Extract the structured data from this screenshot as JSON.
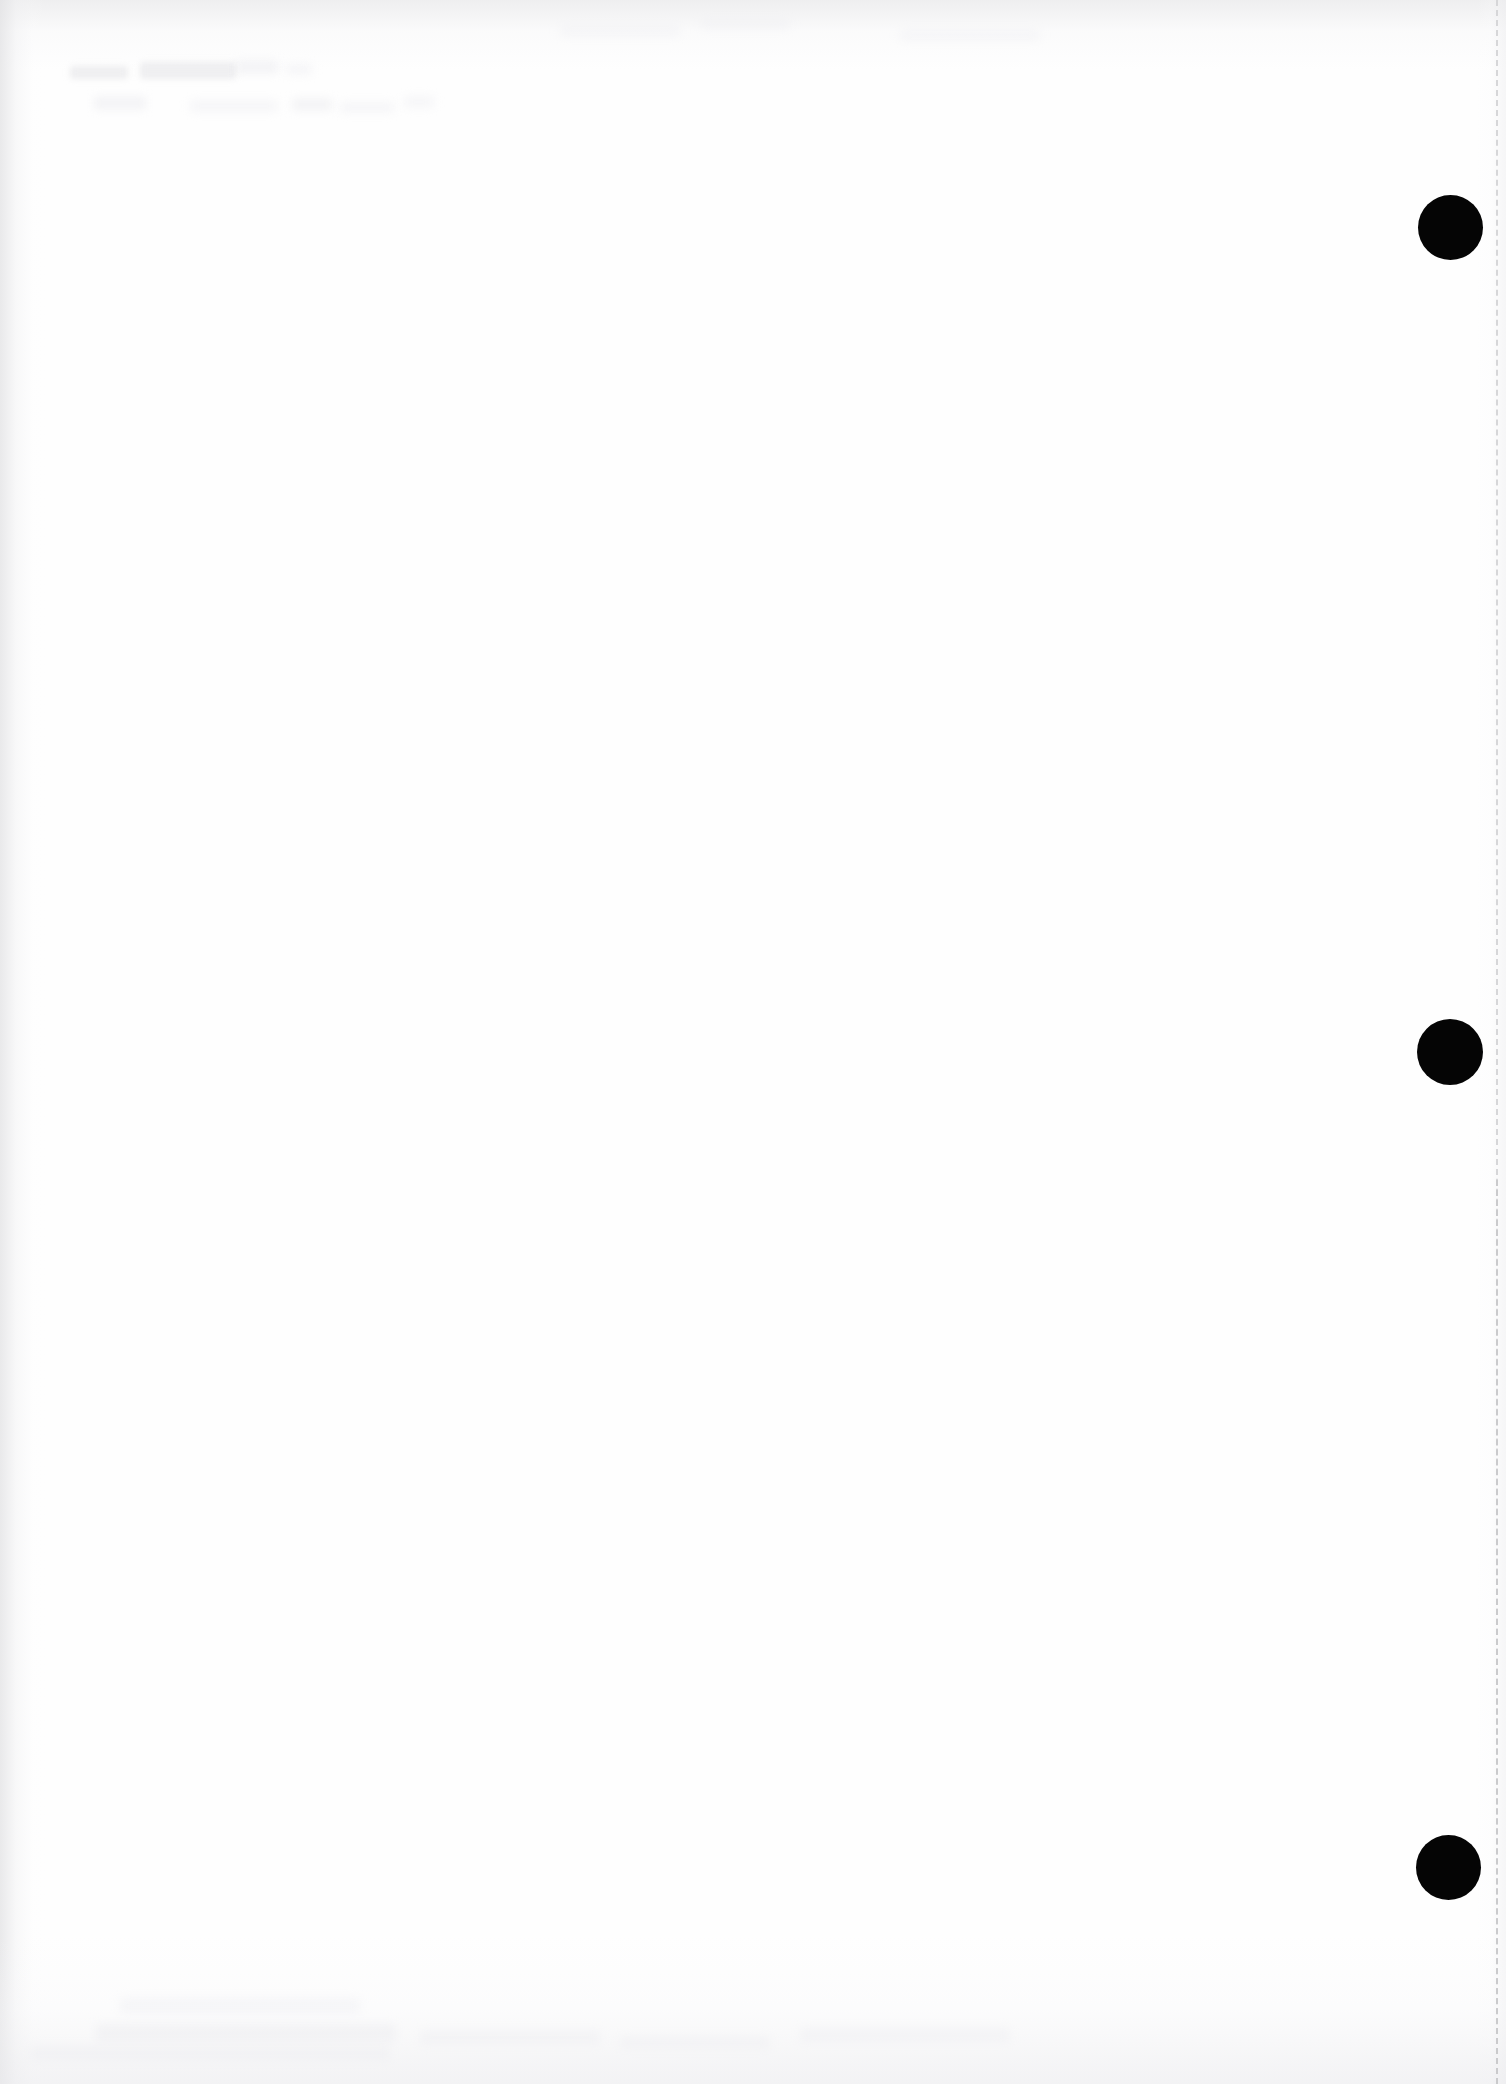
{
  "document": {
    "kind": "scanned-page",
    "title": "Scanned blank page with right-margin registration marks",
    "page_width": 1506,
    "page_height": 2084,
    "paper_color": "#fefefe",
    "content_text": "",
    "visible_text_present": false,
    "notes_label": ""
  },
  "marks": {
    "registration_dots_label": "registration mark",
    "dot_color": "#050505",
    "dots": [
      {
        "id": "registration-dot-1",
        "cx": 1450,
        "cy": 227,
        "diameter": 65
      },
      {
        "id": "registration-dot-2",
        "cx": 1450,
        "cy": 1052,
        "diameter": 66
      },
      {
        "id": "registration-dot-3",
        "cx": 1448,
        "cy": 1867,
        "diameter": 65
      }
    ]
  },
  "guides": {
    "perforation_label": "perforation guide",
    "dash_color": "#d6d6d8",
    "dash_color_lower": "#cacacc",
    "x_position": 1496,
    "dash_length": 11,
    "dash_gap": 11
  },
  "scan_artifacts": {
    "label": "scan noise and bleed-through",
    "vignette_color_left": "#e2e2e4",
    "vignette_color_top": "#e4e4e6",
    "vignette_color_bottom": "#e9e9ec",
    "smudges": [
      {
        "x": 70,
        "y": 66,
        "w": 58,
        "h": 13,
        "class": "bleed-smudge"
      },
      {
        "x": 140,
        "y": 62,
        "w": 96,
        "h": 17,
        "class": "bleed-smudge"
      },
      {
        "x": 236,
        "y": 60,
        "w": 42,
        "h": 14,
        "class": "bleed-smudge soft"
      },
      {
        "x": 286,
        "y": 64,
        "w": 26,
        "h": 11,
        "class": "bleed-smudge faint"
      },
      {
        "x": 94,
        "y": 96,
        "w": 52,
        "h": 14,
        "class": "bleed-smudge soft"
      },
      {
        "x": 190,
        "y": 100,
        "w": 88,
        "h": 12,
        "class": "bleed-smudge faint"
      },
      {
        "x": 292,
        "y": 98,
        "w": 40,
        "h": 13,
        "class": "bleed-smudge soft"
      },
      {
        "x": 340,
        "y": 102,
        "w": 54,
        "h": 11,
        "class": "bleed-smudge faint"
      },
      {
        "x": 404,
        "y": 96,
        "w": 30,
        "h": 12,
        "class": "bleed-smudge faint"
      },
      {
        "x": 120,
        "y": 1998,
        "w": 240,
        "h": 16,
        "class": "bleed-smudge faint"
      },
      {
        "x": 96,
        "y": 2024,
        "w": 300,
        "h": 18,
        "class": "bleed-smudge soft"
      },
      {
        "x": 30,
        "y": 2046,
        "w": 360,
        "h": 14,
        "class": "bleed-smudge faint"
      },
      {
        "x": 420,
        "y": 2030,
        "w": 180,
        "h": 15,
        "class": "bleed-smudge faint"
      },
      {
        "x": 620,
        "y": 2036,
        "w": 150,
        "h": 13,
        "class": "bleed-smudge faint"
      },
      {
        "x": 800,
        "y": 2028,
        "w": 210,
        "h": 14,
        "class": "bleed-smudge faint"
      },
      {
        "x": 560,
        "y": 26,
        "w": 120,
        "h": 10,
        "class": "bleed-smudge faint"
      },
      {
        "x": 700,
        "y": 20,
        "w": 90,
        "h": 9,
        "class": "bleed-smudge faint"
      },
      {
        "x": 900,
        "y": 30,
        "w": 140,
        "h": 10,
        "class": "bleed-smudge faint"
      }
    ]
  }
}
